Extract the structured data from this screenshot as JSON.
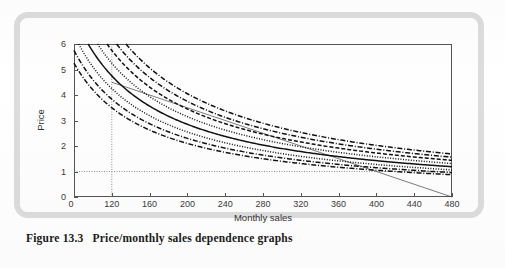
{
  "figure": {
    "number": "Figure 13.3",
    "caption": "Price/monthly sales dependence graphs"
  },
  "chart_data": {
    "type": "line",
    "title": "",
    "xlabel": "Monthly sales",
    "ylabel": "Price",
    "xlim": [
      80,
      480
    ],
    "ylim": [
      0,
      6
    ],
    "grid": false,
    "legend": "none",
    "x_ticks": [
      120,
      160,
      200,
      240,
      280,
      320,
      360,
      400,
      440,
      480
    ],
    "x_tick_labels": [
      "120",
      "160",
      "200",
      "240",
      "280",
      "320",
      "360",
      "400",
      "440",
      "480"
    ],
    "x_origin_label": "0",
    "y_ticks": [
      0,
      1,
      2,
      3,
      4,
      5,
      6
    ],
    "y_tick_labels": [
      "0",
      "1",
      "2",
      "3",
      "4",
      "5",
      "6"
    ],
    "annotations": [
      {
        "name": "reference-line-price-1",
        "type": "hline",
        "y": 1,
        "style": "dotted"
      },
      {
        "name": "reference-line-sales-120",
        "type": "vline",
        "x": 120,
        "style": "dotted"
      }
    ],
    "series": [
      {
        "name": "budget-line",
        "style": "solid-thin",
        "x": [
          120,
          480
        ],
        "values": [
          4.5,
          0.0
        ]
      },
      {
        "name": "hyperbola-k-810",
        "style": "dashdot",
        "k": 810,
        "x": [
          135,
          150,
          170,
          200,
          240,
          280,
          320,
          360,
          400,
          440,
          480
        ],
        "values": [
          6.0,
          5.4,
          4.76,
          4.05,
          3.38,
          2.89,
          2.53,
          2.25,
          2.03,
          1.84,
          1.69
        ]
      },
      {
        "name": "hyperbola-k-750",
        "style": "dashdot",
        "k": 750,
        "x": [
          125,
          150,
          170,
          200,
          240,
          280,
          320,
          360,
          400,
          440,
          480
        ],
        "values": [
          6.0,
          5.0,
          4.41,
          3.75,
          3.13,
          2.68,
          2.34,
          2.08,
          1.88,
          1.7,
          1.56
        ]
      },
      {
        "name": "hyperbola-k-690",
        "style": "dashed",
        "k": 690,
        "x": [
          115,
          150,
          170,
          200,
          240,
          280,
          320,
          360,
          400,
          440,
          480
        ],
        "values": [
          6.0,
          4.6,
          4.06,
          3.45,
          2.88,
          2.46,
          2.16,
          1.92,
          1.73,
          1.57,
          1.44
        ]
      },
      {
        "name": "hyperbola-k-630",
        "style": "dotted",
        "k": 630,
        "x": [
          105,
          150,
          170,
          200,
          240,
          280,
          320,
          360,
          400,
          440,
          480
        ],
        "values": [
          6.0,
          4.2,
          3.71,
          3.15,
          2.63,
          2.25,
          1.97,
          1.75,
          1.58,
          1.43,
          1.31
        ]
      },
      {
        "name": "hyperbola-k-570",
        "style": "solid",
        "k": 570,
        "x": [
          95,
          150,
          170,
          200,
          240,
          280,
          320,
          360,
          400,
          440,
          480
        ],
        "values": [
          6.0,
          3.8,
          3.35,
          2.85,
          2.38,
          2.04,
          1.78,
          1.58,
          1.43,
          1.3,
          1.19
        ]
      },
      {
        "name": "hyperbola-k-510",
        "style": "dotted",
        "k": 510,
        "x": [
          90,
          150,
          170,
          200,
          240,
          280,
          320,
          360,
          400,
          440,
          480
        ],
        "values": [
          5.67,
          3.4,
          3.0,
          2.55,
          2.13,
          1.82,
          1.59,
          1.42,
          1.28,
          1.16,
          1.06
        ]
      },
      {
        "name": "hyperbola-k-460",
        "style": "dashdot",
        "k": 460,
        "x": [
          85,
          150,
          170,
          200,
          240,
          280,
          320,
          360,
          400,
          440,
          480
        ],
        "values": [
          5.41,
          3.07,
          2.71,
          2.3,
          1.92,
          1.64,
          1.44,
          1.28,
          1.15,
          1.05,
          0.96
        ]
      },
      {
        "name": "hyperbola-k-420",
        "style": "dashdot",
        "k": 420,
        "x": [
          82,
          150,
          170,
          200,
          240,
          280,
          320,
          360,
          400,
          440,
          480
        ],
        "values": [
          5.12,
          2.8,
          2.47,
          2.1,
          1.75,
          1.5,
          1.31,
          1.17,
          1.05,
          0.95,
          0.88
        ]
      }
    ]
  }
}
